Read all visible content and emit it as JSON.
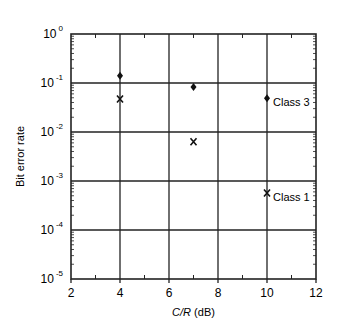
{
  "chart_data": {
    "type": "scatter",
    "title": "",
    "xlabel": "C/R (dB)",
    "xlabel_italic": "C/R",
    "xlabel_unit": "(dB)",
    "ylabel": "Bit error rate",
    "xlim": [
      2,
      12
    ],
    "ylim": [
      1e-05,
      1
    ],
    "yscale": "log",
    "grid": true,
    "x_ticks": [
      "2",
      "4",
      "6",
      "8",
      "10",
      "12"
    ],
    "y_ticks": [
      {
        "base": "10",
        "exp": "0"
      },
      {
        "base": "10",
        "exp": "-1"
      },
      {
        "base": "10",
        "exp": "-2"
      },
      {
        "base": "10",
        "exp": "-3"
      },
      {
        "base": "10",
        "exp": "-4"
      },
      {
        "base": "10",
        "exp": "-5"
      }
    ],
    "series": [
      {
        "name": "Class 3",
        "marker": "diamond",
        "x": [
          4,
          7,
          10
        ],
        "y": [
          0.14,
          0.083,
          0.049
        ]
      },
      {
        "name": "Class 1",
        "marker": "x",
        "x": [
          4,
          7,
          10
        ],
        "y": [
          0.047,
          0.0063,
          0.00057
        ]
      }
    ],
    "annotations": [
      {
        "text": "Class 3",
        "x": 10,
        "y": 0.049
      },
      {
        "text": "Class 1",
        "x": 10,
        "y": 0.00057
      }
    ]
  }
}
